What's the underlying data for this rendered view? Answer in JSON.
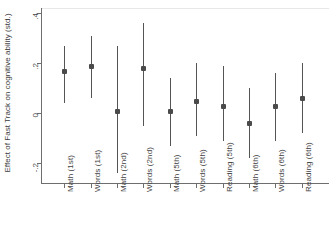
{
  "chart_data": {
    "type": "scatter",
    "title": "",
    "subtitle": "",
    "xlabel": "",
    "ylabel": "Effect of Fast Track on cognitive ability (std.)",
    "ylim": [
      -0.28,
      0.42
    ],
    "yticks": [
      0.4,
      0.2,
      0,
      -0.2
    ],
    "ytick_labels": [
      ".4",
      ".2",
      "0",
      "-.2"
    ],
    "grid": false,
    "legend": null,
    "zero_reference_line": 0,
    "error_bar_type": "confidence interval",
    "categories": [
      "Math (1st)",
      "Words (1st)",
      "Math (2nd)",
      "Words (2nd)",
      "Math (5th)",
      "Words (5th)",
      "Reading (5th)",
      "Math (6th)",
      "Words (6th)",
      "Reading (6th)"
    ],
    "values": [
      0.17,
      0.19,
      0.01,
      0.18,
      0.01,
      0.05,
      0.03,
      -0.04,
      0.03,
      0.06
    ],
    "ci_low": [
      0.04,
      0.06,
      -0.24,
      -0.05,
      -0.13,
      -0.09,
      -0.11,
      -0.18,
      -0.11,
      -0.08
    ],
    "ci_high": [
      0.27,
      0.31,
      0.27,
      0.36,
      0.14,
      0.2,
      0.19,
      0.1,
      0.16,
      0.2
    ],
    "colors": {
      "marker": "#4a4a4a",
      "ci": "#555555",
      "axis": "#6e6e6e",
      "zero_line": "#e8e8e8",
      "text": "#3f3f3f",
      "background": "#ffffff"
    }
  }
}
